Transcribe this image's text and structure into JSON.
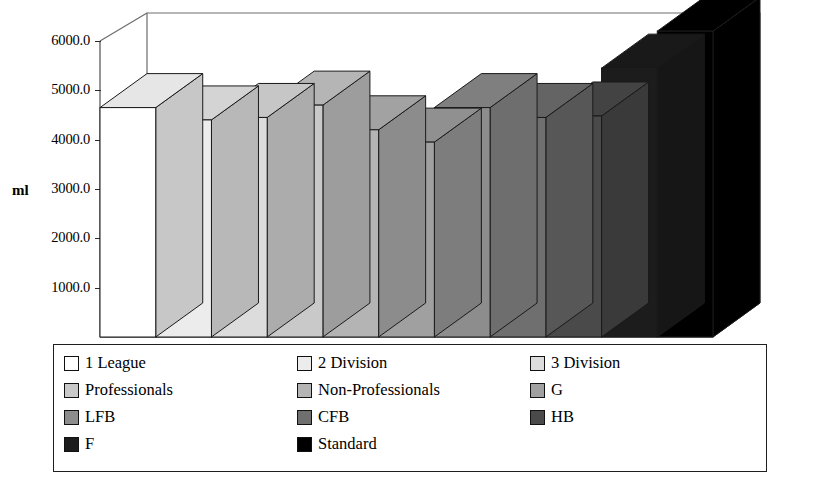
{
  "chart_data": {
    "type": "bar",
    "title": "",
    "xlabel": "",
    "ylabel": "ml",
    "ylim": [
      0,
      6800
    ],
    "grid": false,
    "legend_position": "bottom",
    "style": "3d-isometric-grayscale",
    "y_ticks": [
      "1000.0",
      "2000.0",
      "3000.0",
      "4000.0",
      "5000.0",
      "6000.0"
    ],
    "y_tick_values": [
      1000,
      2000,
      3000,
      4000,
      5000,
      6000
    ],
    "categories": [
      "1 League",
      "2 Division",
      "3 Division",
      "Professionals",
      "Non-Professionals",
      "G",
      "LFB",
      "CFB",
      "HB",
      "F",
      "Standard"
    ],
    "values": [
      4650,
      4400,
      4450,
      4700,
      4200,
      3950,
      4650,
      4450,
      4480,
      5450,
      6200
    ],
    "colors": [
      "#ffffff",
      "#ececec",
      "#dcdcdc",
      "#c9c9c9",
      "#b4b4b4",
      "#a0a0a0",
      "#8d8d8d",
      "#6f6f6f",
      "#4a4a4a",
      "#1c1c1c",
      "#000000"
    ]
  },
  "axis": {
    "y_label": "ml"
  },
  "legend": {
    "entries": [
      {
        "label": "1 League",
        "color": "#ffffff"
      },
      {
        "label": "2 Division",
        "color": "#ececec"
      },
      {
        "label": "3 Division",
        "color": "#dcdcdc"
      },
      {
        "label": "Professionals",
        "color": "#c9c9c9"
      },
      {
        "label": "Non-Professionals",
        "color": "#b4b4b4"
      },
      {
        "label": "G",
        "color": "#a0a0a0"
      },
      {
        "label": "LFB",
        "color": "#8d8d8d"
      },
      {
        "label": "CFB",
        "color": "#6f6f6f"
      },
      {
        "label": "HB",
        "color": "#4a4a4a"
      },
      {
        "label": "F",
        "color": "#1c1c1c"
      },
      {
        "label": "Standard",
        "color": "#000000"
      }
    ]
  },
  "theme": {
    "floor_color": "#a8a8a8",
    "line_color": "#4f4f4f",
    "bar_outline": "#1a1a1a"
  }
}
